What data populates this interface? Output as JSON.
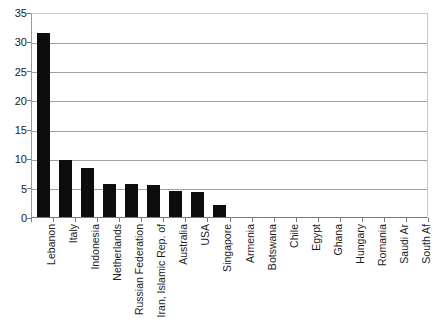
{
  "chart_data": {
    "type": "bar",
    "title": "",
    "subtitle": "",
    "xlabel": "",
    "ylabel": "",
    "ylim": [
      0,
      35
    ],
    "yticks": [
      0,
      5,
      10,
      15,
      20,
      25,
      30,
      35
    ],
    "ytick_labels": [
      "0",
      "5",
      "10",
      "15",
      "20",
      "25",
      "30",
      "35"
    ],
    "grid": true,
    "legend": false,
    "legend_position": "none",
    "bar_color": "#0d0d0d",
    "grid_color": "#a0a0a0",
    "axis_color": "#7a7a7a",
    "categories": [
      "Lebanon",
      "Italy",
      "Indonesia",
      "Netherlands",
      "Russian Federation",
      "Iran, Islamic Rep. of",
      "Australia",
      "USA",
      "Singapore",
      "Armenia",
      "Botswana",
      "Chile",
      "Egypt",
      "Ghana",
      "Hungary",
      "Romania",
      "Saudi Ar",
      "South Af"
    ],
    "values": [
      31.5,
      9.8,
      8.3,
      5.7,
      5.7,
      5.4,
      4.4,
      4.2,
      2.1,
      0,
      0,
      0,
      0,
      0,
      0,
      0,
      0,
      0
    ]
  }
}
